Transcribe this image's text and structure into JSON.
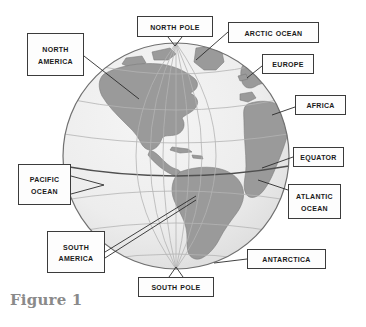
{
  "figure": {
    "caption": "Figure 1",
    "colors": {
      "land": "#9a9a9a",
      "ocean": "#e9e9e9",
      "graticule": "#b4b4b4",
      "equator_line": "#555555",
      "globe_outline": "#6f6f6f",
      "callout_border": "#3b3b3b",
      "callout_fill": "#fdfdfd",
      "label_text": "#1a1a1a",
      "caption_text": "#8a8a8a",
      "page_background": "#ffffff"
    },
    "globe": {
      "center_x": 176,
      "center_y": 156,
      "radius": 114
    }
  },
  "callouts": [
    {
      "id": "north-america",
      "label": "North America",
      "line1": "North",
      "line2": "America"
    },
    {
      "id": "north-pole",
      "label": "North Pole",
      "line1": "North Pole",
      "line2": ""
    },
    {
      "id": "arctic-ocean",
      "label": "Arctic Ocean",
      "line1": "Arctic Ocean",
      "line2": ""
    },
    {
      "id": "europe",
      "label": "Europe",
      "line1": "Europe",
      "line2": ""
    },
    {
      "id": "africa",
      "label": "Africa",
      "line1": "Africa",
      "line2": ""
    },
    {
      "id": "equator",
      "label": "Equator",
      "line1": "Equator",
      "line2": ""
    },
    {
      "id": "atlantic-ocean",
      "label": "Atlantic Ocean",
      "line1": "Atlantic",
      "line2": "Ocean"
    },
    {
      "id": "pacific-ocean",
      "label": "Pacific Ocean",
      "line1": "Pacific",
      "line2": "Ocean"
    },
    {
      "id": "south-america",
      "label": "South America",
      "line1": "South",
      "line2": "America"
    },
    {
      "id": "south-pole",
      "label": "South Pole",
      "line1": "South Pole",
      "line2": ""
    },
    {
      "id": "antarctica",
      "label": "Antarctica",
      "line1": "Antarctica",
      "line2": ""
    }
  ]
}
